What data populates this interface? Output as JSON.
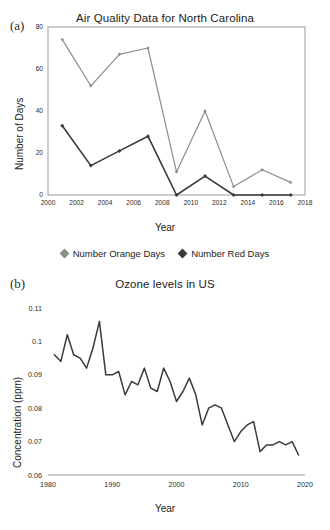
{
  "figure": {
    "panel_a_label": "(a)",
    "panel_b_label": "(b)"
  },
  "chart_data": [
    {
      "id": "air-quality-nc",
      "type": "line",
      "title": "Air Quality Data for North Carolina",
      "xlabel": "Year",
      "ylabel": "Number of Days",
      "xlim": [
        2000,
        2018
      ],
      "ylim": [
        0,
        80
      ],
      "xticks": [
        2000,
        2002,
        2004,
        2006,
        2008,
        2010,
        2012,
        2014,
        2016,
        2018
      ],
      "yticks": [
        0,
        20,
        40,
        60,
        80
      ],
      "grid": false,
      "legend_position": "below",
      "x": [
        2001,
        2003,
        2005,
        2007,
        2009,
        2011,
        2013,
        2015,
        2017
      ],
      "series": [
        {
          "name": "Number Orange Days",
          "color": "#8d8d8d",
          "marker": "diamond",
          "values": [
            74,
            52,
            67,
            70,
            11,
            40,
            4,
            12,
            6
          ]
        },
        {
          "name": "Number Red Days",
          "color": "#3a3a3a",
          "marker": "diamond",
          "values": [
            33,
            14,
            21,
            28,
            0,
            9,
            0,
            0,
            0
          ]
        }
      ]
    },
    {
      "id": "ozone-levels-us",
      "type": "line",
      "title": "Ozone levels in US",
      "xlabel": "Year",
      "ylabel": "Concentration (ppm)",
      "xlim": [
        1980,
        2020
      ],
      "ylim": [
        0.06,
        0.11
      ],
      "xticks": [
        1980,
        1990,
        2000,
        2010,
        2020
      ],
      "yticks": [
        0.06,
        0.07,
        0.08,
        0.09,
        0.1,
        0.11
      ],
      "ytick_labels": [
        "0.06",
        "0.07",
        "0.08",
        "0.09",
        "0.1",
        "0.11"
      ],
      "grid": false,
      "legend_position": "none",
      "series": [
        {
          "name": "Ozone concentration",
          "color": "#3a3a3a",
          "x": [
            1981,
            1982,
            1983,
            1984,
            1985,
            1986,
            1987,
            1988,
            1989,
            1990,
            1991,
            1992,
            1993,
            1994,
            1995,
            1996,
            1997,
            1998,
            1999,
            2000,
            2001,
            2002,
            2003,
            2004,
            2005,
            2006,
            2007,
            2008,
            2009,
            2010,
            2011,
            2012,
            2013,
            2014,
            2015,
            2016,
            2017,
            2018,
            2019
          ],
          "values": [
            0.096,
            0.094,
            0.102,
            0.096,
            0.095,
            0.092,
            0.098,
            0.106,
            0.09,
            0.09,
            0.091,
            0.084,
            0.088,
            0.087,
            0.092,
            0.086,
            0.085,
            0.092,
            0.088,
            0.082,
            0.085,
            0.089,
            0.084,
            0.075,
            0.08,
            0.081,
            0.08,
            0.075,
            0.07,
            0.073,
            0.075,
            0.076,
            0.067,
            0.069,
            0.069,
            0.07,
            0.069,
            0.07,
            0.066
          ]
        }
      ]
    }
  ]
}
